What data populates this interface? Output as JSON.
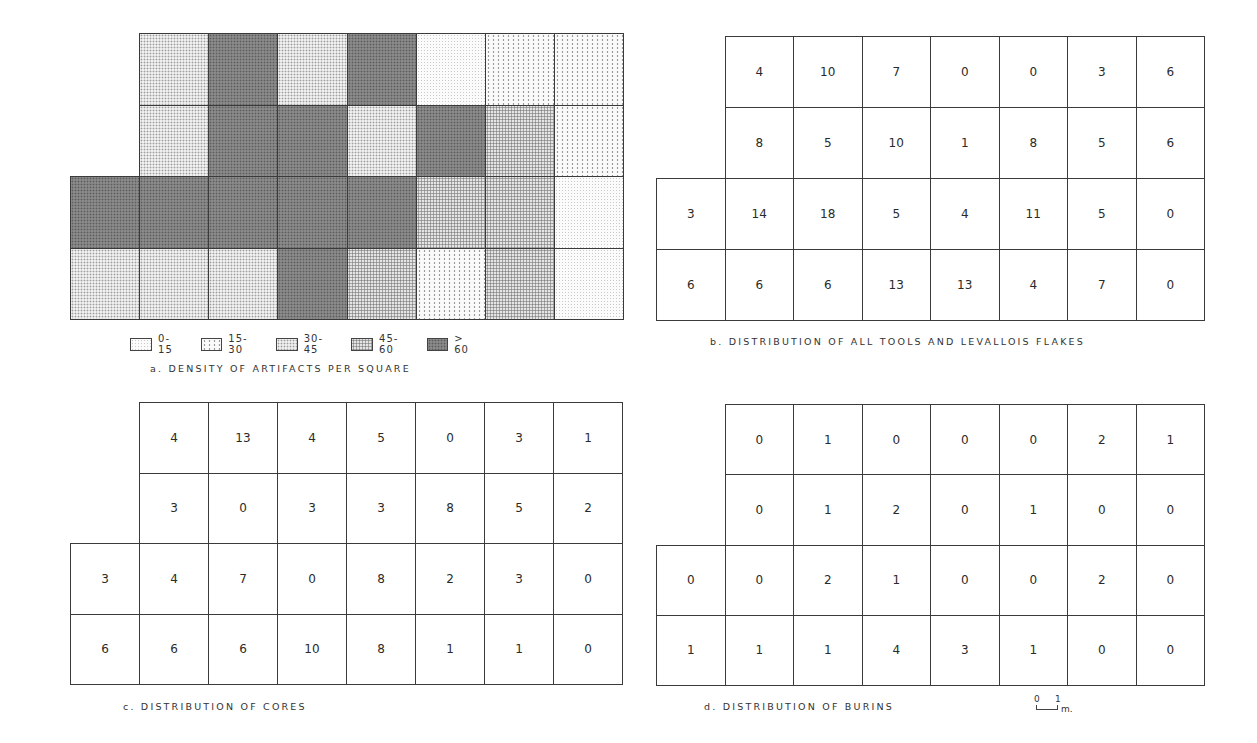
{
  "chart_data": [
    {
      "type": "heatmap",
      "id": "a",
      "title": "a. DENSITY OF ARTIFACTS PER SQUARE",
      "description": "Excavation grid shaded by density class of artifacts per square",
      "rows": 4,
      "columns": 8,
      "layout_note": "Top two rows span columns 2-8 only (first column empty); bottom two rows span all 8 columns",
      "legend": [
        "0-15",
        "15-30",
        "30-45",
        "45-60",
        ">60"
      ],
      "grid": [
        [
          null,
          "30-45",
          ">60",
          "30-45",
          ">60",
          "0-15",
          "15-30",
          "15-30"
        ],
        [
          null,
          "30-45",
          ">60",
          ">60",
          "30-45",
          ">60",
          "45-60",
          "15-30"
        ],
        [
          ">60",
          ">60",
          ">60",
          ">60",
          ">60",
          "45-60",
          "45-60",
          "0-15"
        ],
        [
          "30-45",
          "30-45",
          "30-45",
          ">60",
          "45-60",
          "15-30",
          "45-60",
          "0-15"
        ]
      ]
    },
    {
      "type": "table",
      "id": "b",
      "title": "b. DISTRIBUTION OF ALL TOOLS AND LEVALLOIS FLAKES",
      "rows": 4,
      "columns": 8,
      "grid": [
        [
          null,
          4,
          10,
          7,
          0,
          0,
          3,
          6
        ],
        [
          null,
          8,
          5,
          10,
          1,
          8,
          5,
          6
        ],
        [
          3,
          14,
          18,
          5,
          4,
          11,
          5,
          0
        ],
        [
          6,
          6,
          6,
          13,
          13,
          4,
          7,
          0
        ]
      ]
    },
    {
      "type": "table",
      "id": "c",
      "title": "c. DISTRIBUTION OF CORES",
      "rows": 4,
      "columns": 8,
      "grid": [
        [
          null,
          4,
          13,
          4,
          5,
          0,
          3,
          1
        ],
        [
          null,
          3,
          0,
          3,
          3,
          8,
          5,
          2
        ],
        [
          3,
          4,
          7,
          0,
          8,
          2,
          3,
          0
        ],
        [
          6,
          6,
          6,
          10,
          8,
          1,
          1,
          0
        ]
      ]
    },
    {
      "type": "table",
      "id": "d",
      "title": "d. DISTRIBUTION OF BURINS",
      "rows": 4,
      "columns": 8,
      "grid": [
        [
          null,
          0,
          1,
          0,
          0,
          0,
          2,
          1
        ],
        [
          null,
          0,
          1,
          2,
          0,
          1,
          0,
          0
        ],
        [
          0,
          0,
          2,
          1,
          0,
          0,
          2,
          0
        ],
        [
          1,
          1,
          1,
          4,
          3,
          1,
          0,
          0
        ]
      ],
      "scale_bar": {
        "labels": [
          "0",
          "1"
        ],
        "unit": "m."
      }
    }
  ],
  "panels": {
    "a": {
      "caption": "a. DENSITY OF ARTIFACTS PER SQUARE",
      "legend": [
        {
          "label": "0-15",
          "class": "d0"
        },
        {
          "label": "15-30",
          "class": "d1"
        },
        {
          "label": "30-45",
          "class": "d2"
        },
        {
          "label": "45-60",
          "class": "d3"
        },
        {
          "label": "> 60",
          "class": "d4"
        }
      ],
      "classes": [
        [
          null,
          "d2",
          "d4",
          "d2",
          "d4",
          "d0",
          "d1",
          "d1"
        ],
        [
          null,
          "d2",
          "d4",
          "d4",
          "d2",
          "d4",
          "d3",
          "d1"
        ],
        [
          "d4",
          "d4",
          "d4",
          "d4",
          "d4",
          "d3",
          "d3",
          "d0"
        ],
        [
          "d2",
          "d2",
          "d2",
          "d4",
          "d3",
          "d1",
          "d3",
          "d0"
        ]
      ]
    },
    "b": {
      "caption": "b. DISTRIBUTION OF ALL TOOLS AND LEVALLOIS FLAKES",
      "values": [
        [
          "",
          "4",
          "10",
          "7",
          "0",
          "0",
          "3",
          "6"
        ],
        [
          "",
          "8",
          "5",
          "10",
          "1",
          "8",
          "5",
          "6"
        ],
        [
          "3",
          "14",
          "18",
          "5",
          "4",
          "11",
          "5",
          "0"
        ],
        [
          "6",
          "6",
          "6",
          "13",
          "13",
          "4",
          "7",
          "0"
        ]
      ]
    },
    "c": {
      "caption": "c. DISTRIBUTION OF CORES",
      "values": [
        [
          "",
          "4",
          "13",
          "4",
          "5",
          "0",
          "3",
          "1"
        ],
        [
          "",
          "3",
          "0",
          "3",
          "3",
          "8",
          "5",
          "2"
        ],
        [
          "3",
          "4",
          "7",
          "0",
          "8",
          "2",
          "3",
          "0"
        ],
        [
          "6",
          "6",
          "6",
          "10",
          "8",
          "1",
          "1",
          "0"
        ]
      ]
    },
    "d": {
      "caption": "d. DISTRIBUTION OF BURINS",
      "values": [
        [
          "",
          "0",
          "1",
          "0",
          "0",
          "0",
          "2",
          "1"
        ],
        [
          "",
          "0",
          "1",
          "2",
          "0",
          "1",
          "0",
          "0"
        ],
        [
          "0",
          "0",
          "2",
          "1",
          "0",
          "0",
          "2",
          "0"
        ],
        [
          "1",
          "1",
          "1",
          "4",
          "3",
          "1",
          "0",
          "0"
        ]
      ],
      "scale": {
        "zero": "0",
        "one": "1",
        "unit": "m."
      }
    }
  }
}
